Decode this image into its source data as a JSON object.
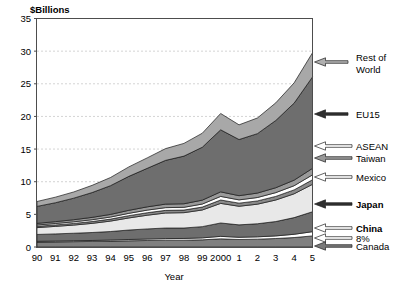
{
  "chart_data": {
    "type": "area",
    "title": "",
    "ylabel": "$Billions",
    "xlabel": "Year",
    "ylim": [
      0,
      35
    ],
    "yticks": [
      0,
      5,
      10,
      15,
      20,
      25,
      30,
      35
    ],
    "grid": true,
    "legend_position": "right-callouts",
    "categories": [
      "90",
      "91",
      "92",
      "93",
      "94",
      "95",
      "96",
      "97",
      "98",
      "99",
      "2000",
      "1",
      "2",
      "3",
      "4",
      "5"
    ],
    "stacked": true,
    "annotations": [
      "8%"
    ],
    "series": [
      {
        "name": "Canada",
        "color": "#808080",
        "values": [
          0.75,
          0.78,
          0.82,
          0.85,
          0.9,
          0.95,
          1.0,
          1.05,
          1.05,
          1.1,
          1.25,
          1.15,
          1.2,
          1.3,
          1.45,
          1.7
        ]
      },
      {
        "name": "8%",
        "color": "#ffffff",
        "values": [
          0.12,
          0.13,
          0.14,
          0.15,
          0.17,
          0.2,
          0.22,
          0.24,
          0.26,
          0.3,
          0.38,
          0.34,
          0.36,
          0.4,
          0.5,
          0.65
        ]
      },
      {
        "name": "China",
        "color": "#6e6e6e",
        "values": [
          1.05,
          1.1,
          1.15,
          1.22,
          1.3,
          1.45,
          1.55,
          1.62,
          1.6,
          1.72,
          2.05,
          1.9,
          2.0,
          2.2,
          2.55,
          3.05
        ]
      },
      {
        "name": "Japan",
        "color": "#e8e8e8",
        "values": [
          1.05,
          1.15,
          1.25,
          1.4,
          1.6,
          1.85,
          2.1,
          2.3,
          2.35,
          2.55,
          3.0,
          2.85,
          3.0,
          3.3,
          3.65,
          4.2
        ]
      },
      {
        "name": "Mexico",
        "color": "#8a8a8a",
        "values": [
          0.2,
          0.22,
          0.25,
          0.28,
          0.3,
          0.35,
          0.38,
          0.4,
          0.4,
          0.45,
          0.52,
          0.48,
          0.5,
          0.55,
          0.6,
          0.7
        ]
      },
      {
        "name": "Taiwan",
        "color": "#ffffff",
        "values": [
          0.2,
          0.22,
          0.25,
          0.28,
          0.32,
          0.36,
          0.4,
          0.42,
          0.42,
          0.46,
          0.55,
          0.5,
          0.52,
          0.58,
          0.64,
          0.75
        ]
      },
      {
        "name": "ASEAN",
        "color": "#9a9a9a",
        "values": [
          0.25,
          0.28,
          0.32,
          0.36,
          0.4,
          0.46,
          0.5,
          0.54,
          0.54,
          0.6,
          0.7,
          0.64,
          0.68,
          0.75,
          0.85,
          1.0
        ]
      },
      {
        "name": "EU15",
        "color": "#6e6e6e",
        "values": [
          2.6,
          2.9,
          3.3,
          3.8,
          4.4,
          5.2,
          5.9,
          6.7,
          7.3,
          8.1,
          9.5,
          8.6,
          9.1,
          10.3,
          11.8,
          14.0
        ]
      },
      {
        "name": "Rest of World",
        "color": "#a8a8a8",
        "values": [
          0.75,
          0.85,
          0.95,
          1.1,
          1.25,
          1.45,
          1.6,
          1.8,
          1.95,
          2.15,
          2.5,
          2.25,
          2.4,
          2.7,
          3.1,
          3.7
        ]
      }
    ]
  },
  "callouts": [
    {
      "label_line1": "Rest of",
      "label_line2": "World",
      "bold": false,
      "arrow_fill": "#b0b0b0"
    },
    {
      "label_line1": "EU15",
      "label_line2": "",
      "bold": false,
      "arrow_fill": "#2f2f2f"
    },
    {
      "label_line1": "ASEAN",
      "label_line2": "",
      "bold": false,
      "arrow_fill": "#ffffff"
    },
    {
      "label_line1": "Taiwan",
      "label_line2": "",
      "bold": false,
      "arrow_fill": "#9a9a9a"
    },
    {
      "label_line1": "Mexico",
      "label_line2": "",
      "bold": false,
      "arrow_fill": "#ffffff"
    },
    {
      "label_line1": "Japan",
      "label_line2": "",
      "bold": true,
      "arrow_fill": "#2f2f2f"
    },
    {
      "label_line1": "China",
      "label_line2": "",
      "bold": true,
      "arrow_fill": "#ffffff"
    },
    {
      "label_line1": "8%",
      "label_line2": "",
      "bold": false,
      "arrow_fill": "#ffffff"
    },
    {
      "label_line1": "Canada",
      "label_line2": "",
      "bold": false,
      "arrow_fill": "#7a7a7a"
    }
  ]
}
